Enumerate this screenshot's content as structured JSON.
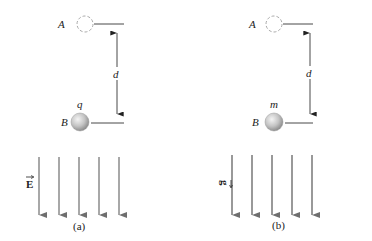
{
  "panels": [
    {
      "id": "a",
      "caption": "(a)",
      "start_label": "A",
      "end_label": "B",
      "distance_label": "d",
      "particle_label": "q",
      "field_label": "E",
      "field_vector_marker": "→",
      "field_lines": 5,
      "field_direction": "down"
    },
    {
      "id": "b",
      "caption": "(b)",
      "start_label": "A",
      "end_label": "B",
      "distance_label": "d",
      "particle_label": "m",
      "field_label": "g",
      "field_vector_marker": "→",
      "field_lines": 5,
      "field_direction": "down"
    }
  ],
  "colors": {
    "background": "#ffffff",
    "text": "#222222",
    "lines": "#333333",
    "field_arrows": "#6e6e6e",
    "dashed_circle": "#aaaaaa",
    "sphere_light": "#f2f2f2",
    "sphere_dark": "#8c8c8c"
  }
}
